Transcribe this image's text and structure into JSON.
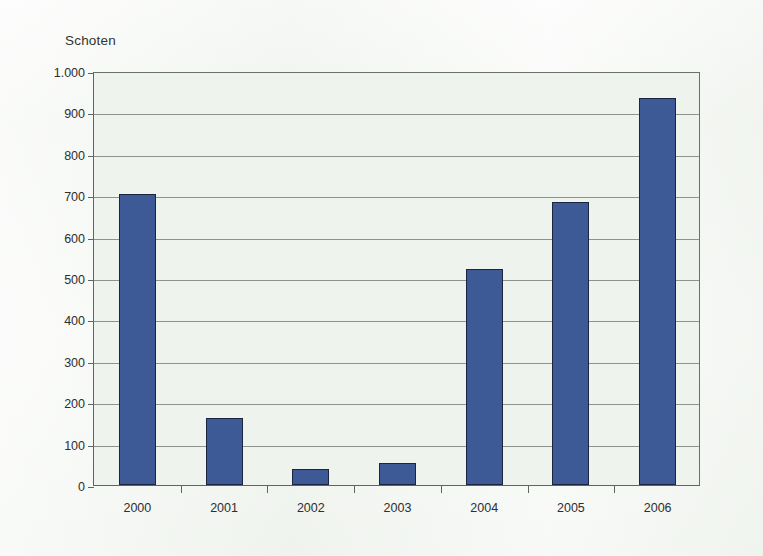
{
  "chart_data": {
    "type": "bar",
    "title": "Schoten",
    "xlabel": "",
    "ylabel": "Schoten",
    "categories": [
      "2000",
      "2001",
      "2002",
      "2003",
      "2004",
      "2005",
      "2006"
    ],
    "values": [
      702,
      162,
      39,
      54,
      522,
      683,
      934
    ],
    "series": [
      {
        "name": "Schoten",
        "values": [
          702,
          162,
          39,
          54,
          522,
          683,
          934
        ]
      }
    ],
    "ylim": [
      0,
      1000
    ],
    "ytick_values": [
      0,
      100,
      200,
      300,
      400,
      500,
      600,
      700,
      800,
      900,
      1000
    ],
    "ytick_labels": [
      "0",
      "100",
      "200",
      "300",
      "400",
      "500",
      "600",
      "700",
      "800",
      "900",
      "1.000"
    ],
    "grid": true,
    "legend": "none",
    "bar_color": "#3d5a96",
    "bar_border_color": "#1b2540",
    "plot_background": "#eff3ee",
    "axis_color": "#5f6560",
    "gridline_color": "#8d938e"
  }
}
